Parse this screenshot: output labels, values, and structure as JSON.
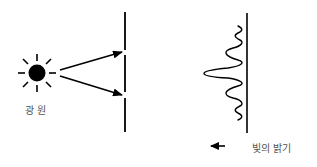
{
  "diagram": {
    "source": {
      "label": "광 원",
      "icon": "sun-icon",
      "center": [
        37,
        73
      ],
      "radius": 9,
      "ray_count": 8
    },
    "barrier": {
      "x": 125,
      "segments": [
        [
          12,
          50
        ],
        [
          55,
          92
        ],
        [
          98,
          132
        ]
      ],
      "slits_y": [
        52,
        95
      ]
    },
    "rays": [
      {
        "from": [
          60,
          70
        ],
        "to": [
          122,
          52
        ]
      },
      {
        "from": [
          60,
          76
        ],
        "to": [
          122,
          95
        ]
      }
    ],
    "screen": {
      "x": 247,
      "y_range": [
        13,
        133
      ]
    },
    "intensity_pattern": {
      "center_y": 73,
      "peak_offset": 45,
      "description": "central maximum with diminishing side fringes"
    },
    "legend": {
      "arrow": "left-arrow",
      "label": "빛의 밝기"
    },
    "colors": {
      "stroke": "#000000",
      "label": "#555555",
      "background": "#ffffff"
    }
  }
}
